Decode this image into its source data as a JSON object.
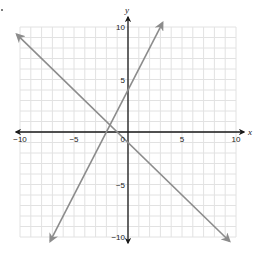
{
  "chart_data": {
    "type": "line",
    "title": "",
    "xlabel": "x",
    "ylabel": "y",
    "xlim": [
      -10,
      10
    ],
    "ylim": [
      -10,
      10
    ],
    "grid": true,
    "grid_step": 1,
    "x_ticks": [
      {
        "value": -10,
        "label": "−10"
      },
      {
        "value": -5,
        "label": "−5"
      },
      {
        "value": 5,
        "label": "5"
      },
      {
        "value": 10,
        "label": "10"
      }
    ],
    "y_ticks": [
      {
        "value": 10,
        "label": "10"
      },
      {
        "value": 5,
        "label": "5"
      },
      {
        "value": -5,
        "label": "−5"
      },
      {
        "value": -10,
        "label": "−10"
      }
    ],
    "origin_label": "0",
    "series": [
      {
        "name": "line-1",
        "equation": "y = 2x + 4",
        "slope": 2,
        "intercept": 4,
        "x_range": [
          -7.2,
          3.2
        ]
      },
      {
        "name": "line-2",
        "equation": "y = -x - 1",
        "slope": -1,
        "intercept": -1,
        "x_range": [
          -10.3,
          9.4
        ]
      }
    ],
    "colors": {
      "lines": "#8c8c8c",
      "axes": "#1a1a1a",
      "grid": "#e2e2e2",
      "text": "#222222"
    }
  }
}
